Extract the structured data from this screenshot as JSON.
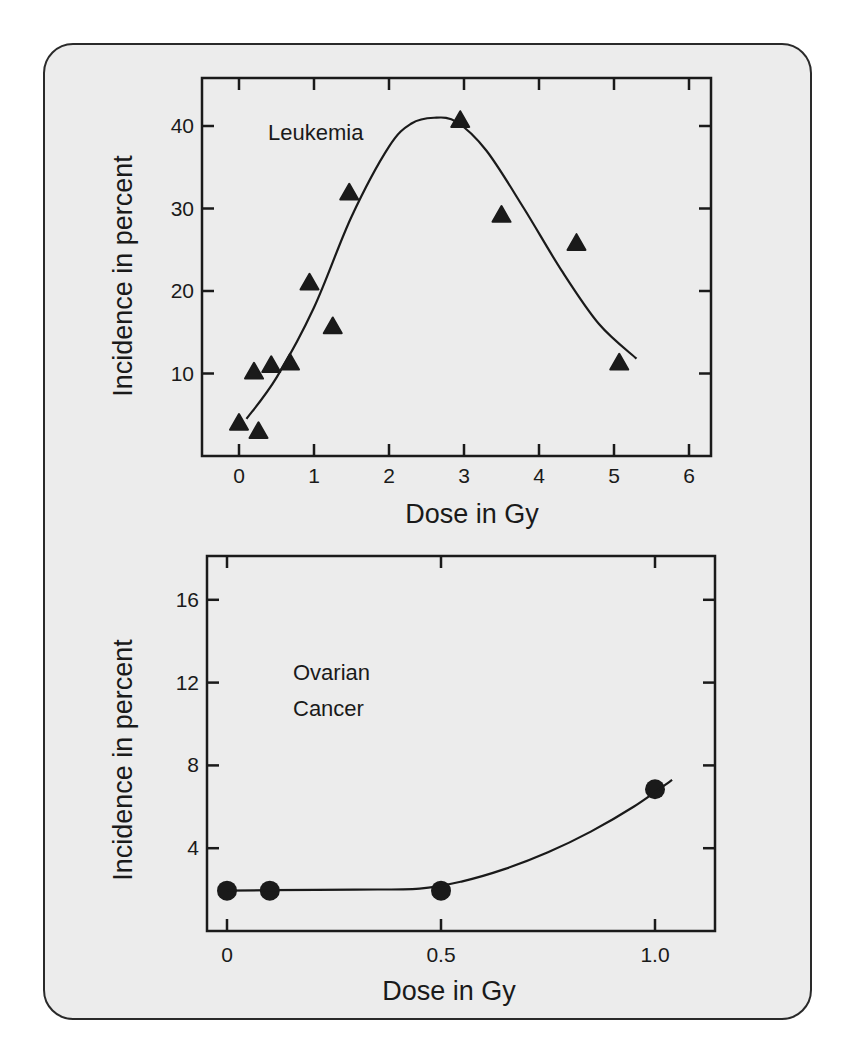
{
  "figure": {
    "frame_background": "#ececec",
    "frame_border": "#2a2a2a",
    "ink": "#1a1a1a"
  },
  "chart_data": [
    {
      "id": "leukemia",
      "type": "scatter",
      "title": "",
      "annotation": "Leukemia",
      "xlabel": "Dose in Gy",
      "ylabel": "Incidence in percent",
      "xlim": [
        -0.45,
        6.3
      ],
      "ylim": [
        0,
        46
      ],
      "xticks": [
        0,
        1,
        2,
        3,
        4,
        5,
        6
      ],
      "xtick_labels": [
        "0",
        "1",
        "2",
        "3",
        "4",
        "5",
        "6"
      ],
      "yticks": [
        10,
        20,
        30,
        40
      ],
      "ytick_labels": [
        "10",
        "20",
        "30",
        "40"
      ],
      "grid": false,
      "legend": "none",
      "marker": "triangle",
      "series": [
        {
          "name": "Leukemia observed",
          "x": [
            0,
            0.26,
            0.2,
            0.43,
            0.68,
            0.94,
            1.25,
            1.47,
            2.95,
            3.5,
            4.5,
            5.07
          ],
          "y": [
            4.0,
            3.0,
            10.2,
            11.0,
            11.3,
            21.0,
            15.7,
            31.9,
            40.7,
            29.2,
            25.8,
            11.3
          ]
        },
        {
          "name": "Leukemia fitted curve",
          "type": "line",
          "x": [
            0.1,
            0.5,
            1.0,
            1.5,
            2.0,
            2.3,
            2.6,
            2.9,
            3.3,
            3.8,
            4.3,
            4.8,
            5.3
          ],
          "y": [
            4.5,
            9.5,
            18.0,
            29.0,
            37.5,
            40.3,
            41.0,
            40.5,
            37.0,
            30.0,
            22.5,
            16.0,
            11.8
          ]
        }
      ]
    },
    {
      "id": "ovarian",
      "type": "scatter",
      "title": "",
      "annotation": [
        "Ovarian",
        "Cancer"
      ],
      "xlabel": "Dose in Gy",
      "ylabel": "Incidence in percent",
      "xlim": [
        -0.05,
        1.15
      ],
      "ylim": [
        0,
        18
      ],
      "xticks": [
        0,
        0.5,
        1.0
      ],
      "xtick_labels": [
        "0",
        "0.5",
        "1.0"
      ],
      "yticks": [
        4,
        8,
        12,
        16
      ],
      "ytick_labels": [
        "4",
        "8",
        "12",
        "16"
      ],
      "grid": false,
      "legend": "none",
      "marker": "circle",
      "series": [
        {
          "name": "Ovarian cancer observed",
          "x": [
            0,
            0.1,
            0.5,
            1.0
          ],
          "y": [
            1.95,
            1.95,
            1.95,
            6.85
          ]
        },
        {
          "name": "Ovarian cancer fitted curve",
          "type": "line",
          "x": [
            0,
            0.1,
            0.3,
            0.45,
            0.55,
            0.65,
            0.75,
            0.85,
            0.95,
            1.04
          ],
          "y": [
            1.95,
            1.97,
            2.0,
            2.05,
            2.4,
            3.0,
            3.8,
            4.8,
            6.0,
            7.3
          ]
        }
      ]
    }
  ]
}
